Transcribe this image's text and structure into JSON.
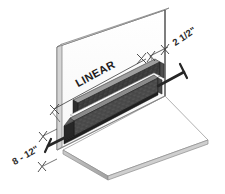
{
  "drawing": {
    "title": "Linear Wall Bumper Isometric Installation Detail",
    "labels": {
      "product": "LINEAR",
      "dimension_height": "2 1/2\"",
      "dimension_spacing": "8 - 12\""
    },
    "components": {
      "wall_name": "wall-panel",
      "floor_name": "floor-slab",
      "bumper_name": "linear-bumper",
      "upper_rail_name": "bumper-upper-rail",
      "lower_rail_name": "bumper-lower-rail",
      "bolt_right_name": "anchor-bolt-right",
      "bolt_left_name": "anchor-bolt-left"
    },
    "colors": {
      "wall_face": "#fdfdfd",
      "wall_edge": "#9a9a9a",
      "wall_outline": "#555555",
      "floor_face": "#ffffff",
      "floor_edge": "#b4b4b4",
      "bumper_dark": "#3a3a3a",
      "bumper_mid": "#4d4d4d",
      "bumper_bevel": "#8f8f8f",
      "bumper_light": "#d8d8d8",
      "bolt": "#2a2a2a",
      "dimension_line": "#3c3c3c",
      "text": "#1d1d1d"
    }
  }
}
